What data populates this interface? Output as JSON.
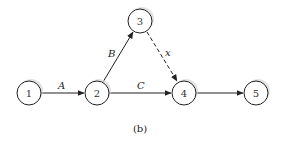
{
  "diagram": {
    "type": "activity-on-arrow network",
    "caption": "(b)",
    "colors": {
      "stroke": "#222222",
      "shadow": "#cfcfcf",
      "background": "#ffffff"
    },
    "nodes": [
      {
        "id": "1",
        "label": "1",
        "cx": 29,
        "cy": 93
      },
      {
        "id": "2",
        "label": "2",
        "cx": 97,
        "cy": 93
      },
      {
        "id": "3",
        "label": "3",
        "cx": 140,
        "cy": 21
      },
      {
        "id": "4",
        "label": "4",
        "cx": 184,
        "cy": 93
      },
      {
        "id": "5",
        "label": "5",
        "cx": 256,
        "cy": 93
      }
    ],
    "edges": [
      {
        "from": "1",
        "to": "2",
        "label": "A",
        "style": "solid"
      },
      {
        "from": "2",
        "to": "3",
        "label": "B",
        "style": "solid"
      },
      {
        "from": "2",
        "to": "4",
        "label": "C",
        "style": "solid"
      },
      {
        "from": "3",
        "to": "4",
        "label": "x",
        "style": "dashed"
      },
      {
        "from": "4",
        "to": "5",
        "label": "",
        "style": "solid"
      }
    ]
  }
}
